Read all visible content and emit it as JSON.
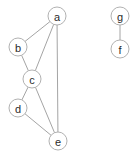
{
  "diagram": {
    "type": "undirected-graph",
    "title": "",
    "width": 140,
    "height": 156,
    "background_color": "#ffffff",
    "node_style": {
      "shape": "circle",
      "radius": 9,
      "fill_color": "#ffffff",
      "stroke_color": "#a8a8a8",
      "stroke_width": 0.9,
      "label_color": "#2b2b2b",
      "label_font_size": 11
    },
    "edge_style": {
      "stroke_color": "#9a9a9a",
      "stroke_width": 0.9
    },
    "nodes": [
      {
        "id": "a",
        "label": "a",
        "x": 57,
        "y": 16
      },
      {
        "id": "b",
        "label": "b",
        "x": 18,
        "y": 47
      },
      {
        "id": "c",
        "label": "c",
        "x": 32,
        "y": 79
      },
      {
        "id": "d",
        "label": "d",
        "x": 18,
        "y": 108
      },
      {
        "id": "e",
        "label": "e",
        "x": 58,
        "y": 141
      },
      {
        "id": "g",
        "label": "g",
        "x": 120,
        "y": 16
      },
      {
        "id": "f",
        "label": "f",
        "x": 120,
        "y": 49
      }
    ],
    "edges": [
      {
        "id": "a-b",
        "source": "a",
        "target": "b"
      },
      {
        "id": "a-c",
        "source": "a",
        "target": "c"
      },
      {
        "id": "a-e",
        "source": "a",
        "target": "e"
      },
      {
        "id": "b-c",
        "source": "b",
        "target": "c"
      },
      {
        "id": "c-d",
        "source": "c",
        "target": "d"
      },
      {
        "id": "c-e",
        "source": "c",
        "target": "e"
      },
      {
        "id": "d-e",
        "source": "d",
        "target": "e"
      },
      {
        "id": "g-f",
        "source": "g",
        "target": "f"
      }
    ],
    "components": [
      {
        "name": "component-1",
        "members": [
          "a",
          "b",
          "c",
          "d",
          "e"
        ]
      },
      {
        "name": "component-2",
        "members": [
          "g",
          "f"
        ]
      }
    ]
  }
}
